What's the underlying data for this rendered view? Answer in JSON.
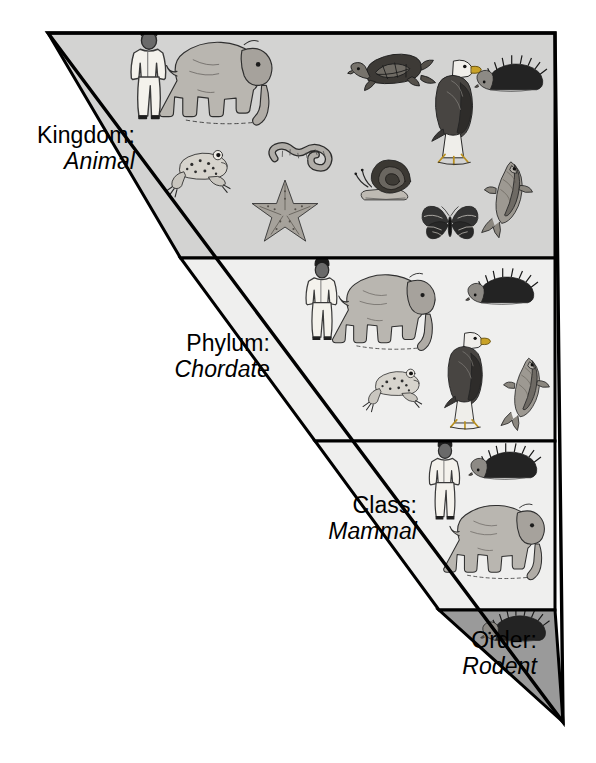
{
  "diagram": {
    "type": "nested-triangle-hierarchy",
    "geometry": {
      "apex_top_left": [
        48,
        33
      ],
      "top_right": [
        555,
        33
      ],
      "bottom_tip": [
        563,
        722
      ],
      "outline_color": "#000000",
      "outline_width": 3
    },
    "levels": [
      {
        "id": "kingdom",
        "rank": "Kingdom:",
        "taxon": "Animal",
        "band_top": 33,
        "band_bottom": 258,
        "fill": "#d3d3d2",
        "organisms": [
          "human",
          "elephant",
          "turtle",
          "bald-eagle",
          "hedgehog",
          "frog",
          "earthworm",
          "starfish",
          "snail",
          "butterfly",
          "fish"
        ],
        "organism_count": 11
      },
      {
        "id": "phylum",
        "rank": "Phylum:",
        "taxon": "Chordate",
        "band_top": 258,
        "band_bottom": 441,
        "fill": "#efefee",
        "organisms": [
          "human",
          "elephant",
          "hedgehog",
          "frog",
          "bald-eagle",
          "fish"
        ],
        "organism_count": 6
      },
      {
        "id": "class",
        "rank": "Class:",
        "taxon": "Mammal",
        "band_top": 441,
        "band_bottom": 610,
        "fill": "#efefee",
        "organisms": [
          "human",
          "hedgehog",
          "elephant"
        ],
        "organism_count": 3
      },
      {
        "id": "order",
        "rank": "Order:",
        "taxon": "Rodent",
        "band_top": 610,
        "band_bottom": 722,
        "fill": "#9a9a9a",
        "organisms": [
          "hedgehog"
        ],
        "organism_count": 1
      }
    ],
    "colors": {
      "page_background": "#ffffff",
      "ink": "#000000",
      "band_kingdom": "#d3d3d2",
      "band_phylum": "#efefee",
      "band_class": "#efefee",
      "band_order": "#9a9a9a",
      "illustration_ink": "#3a3a3a"
    }
  }
}
